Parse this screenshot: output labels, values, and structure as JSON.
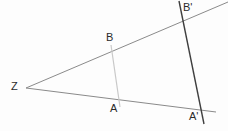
{
  "figure": {
    "background_color": "#fdfdfd",
    "width": 228,
    "height": 131,
    "labels": {
      "z": "Z",
      "b": "B",
      "a": "A",
      "b_prime": "B'",
      "a_prime": "A'"
    },
    "colors": {
      "ray": "#8a8a8a",
      "segment_ab": "#c9c9c9",
      "segment_ab_prime": "#3f3f3f",
      "label": "#2b2b2b"
    }
  },
  "chart_data": {
    "type": "diagram",
    "points": [
      {
        "name": "Z",
        "x": 26,
        "y": 88,
        "label": "Z",
        "label_x": 11,
        "label_y": 81
      },
      {
        "name": "B",
        "x": 111,
        "y": 47,
        "label": "B",
        "label_x": 106,
        "label_y": 32
      },
      {
        "name": "A",
        "x": 119,
        "y": 101,
        "label": "A",
        "label_x": 110,
        "label_y": 103
      },
      {
        "name": "B'",
        "x": 181,
        "y": 17,
        "label": "B'",
        "label_x": 183,
        "label_y": 2
      },
      {
        "name": "A'",
        "x": 202,
        "y": 111,
        "label": "A'",
        "label_x": 189,
        "label_y": 111
      }
    ],
    "lines": [
      {
        "name": "upper-ray",
        "from": [
          26,
          88
        ],
        "to": [
          228,
          2
        ],
        "color": "#8a8a8a",
        "width": 1,
        "role": "ray from Z through B and B'"
      },
      {
        "name": "lower-ray",
        "from": [
          26,
          88
        ],
        "to": [
          216,
          112
        ],
        "color": "#8a8a8a",
        "width": 1,
        "role": "ray from Z through A and A'"
      },
      {
        "name": "segment-AB",
        "from": [
          111,
          45
        ],
        "to": [
          120,
          107
        ],
        "color": "#c9c9c9",
        "width": 1.2,
        "role": "transversal through A and B"
      },
      {
        "name": "segment-ABprime",
        "from": [
          179,
          1
        ],
        "to": [
          204,
          124
        ],
        "color": "#3f3f3f",
        "width": 1.4,
        "role": "transversal through A' and B'"
      }
    ],
    "xlabel": "",
    "ylabel": "",
    "grid": false,
    "legend": "none"
  }
}
